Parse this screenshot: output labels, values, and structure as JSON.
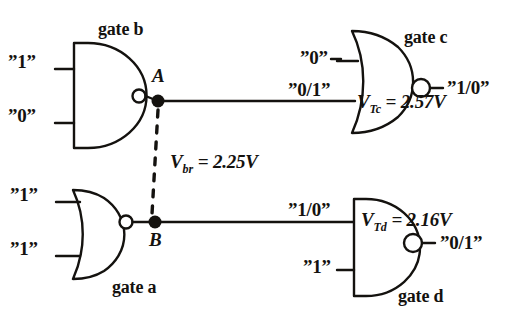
{
  "figure": {
    "type": "logic-circuit-bridging-fault",
    "background_color": "#ffffff",
    "ink_color": "#14120f"
  },
  "gates": [
    {
      "id": "b",
      "name_label": "gate b",
      "logic": "NAND",
      "inputs": [
        "”1”",
        "”0”"
      ],
      "output_node": "A"
    },
    {
      "id": "a",
      "name_label": "gate a",
      "logic": "NOR",
      "inputs": [
        "”1”",
        "”1”"
      ],
      "output_node": "B"
    },
    {
      "id": "c",
      "name_label": "gate c",
      "logic": "NOR",
      "inputs": [
        "”0”",
        "”0/1”"
      ],
      "output": "”1/0”",
      "threshold_symbol": "V",
      "threshold_subscript": "Tc",
      "threshold_equation": "= 2.57V"
    },
    {
      "id": "d",
      "name_label": "gate d",
      "logic": "NAND",
      "inputs": [
        "”1/0”",
        "”1”"
      ],
      "output": "”0/1”",
      "threshold_symbol": "V",
      "threshold_subscript": "Td",
      "threshold_equation": "= 2.16V"
    }
  ],
  "nodes": {
    "a_label": "A",
    "b_label": "B"
  },
  "bridge": {
    "symbol": "V",
    "subscript": "br",
    "equation": "= 2.25V",
    "style": "dashed"
  }
}
